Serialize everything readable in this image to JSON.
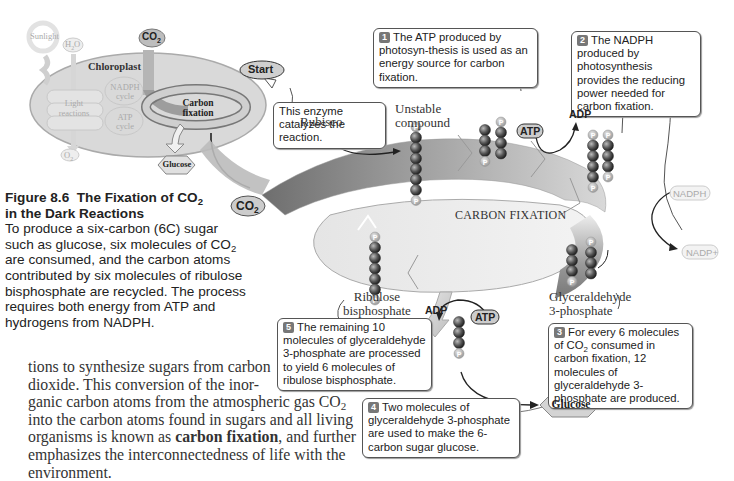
{
  "figure": {
    "number": "Figure 8.6",
    "title_prefix": "The Fixation of CO",
    "title_sub": "2",
    "title_suffix": "in the Dark Reactions",
    "caption_1": "To produce a six-carbon (6C) sugar such as glucose, six molecules of CO",
    "caption_sub": "2",
    "caption_2": " are consumed, and the carbon atoms contributed by six molecules of ribulose bisphosphate are recycled. The process requires both energy from ATP and hydrogens from NADPH."
  },
  "inset": {
    "sunlight": "Sunlight",
    "h2o": "H2O",
    "h2o_main": "H",
    "h2o_sub": "2",
    "h2o_end": "O",
    "co2_main": "CO",
    "co2_sub": "2",
    "chloroplast": "Chloroplast",
    "nadph_cycle_1": "NADPH",
    "nadph_cycle_2": "cycle",
    "atp_cycle_1": "ATP",
    "atp_cycle_2": "cycle",
    "light_1": "Light",
    "light_2": "reactions",
    "carbon_1": "Carbon",
    "carbon_2": "fixation",
    "o2_main": "O",
    "o2_sub": "2",
    "glucose": "Glucose"
  },
  "cycle": {
    "title": "CARBON FIXATION",
    "start": "Start",
    "rubisco": "Rubisco",
    "unstable_1": "Unstable",
    "unstable_2": "compound",
    "g3p_1": "Glyceraldehyde",
    "g3p_2": "3-phosphate",
    "rubp_1": "Ribulose",
    "rubp_2": "bisphosphate",
    "co2_main": "CO",
    "co2_sub": "2",
    "atp_top": "ATP",
    "adp_top": "ADP",
    "nadph": "NADPH",
    "nadp": "NADP+",
    "atp_bottom": "ATP",
    "adp_bottom": "ADP",
    "glucose": "Glucose",
    "phosphate": "P"
  },
  "callouts": {
    "enzyme": "This enzyme catalyzes the reaction.",
    "c1_num": "1",
    "c1": "The ATP produced by photosyn-thesis is used as an energy source for carbon fixation.",
    "c2_num": "2",
    "c2": "The NADPH produced by photosynthesis provides the reducing power needed for carbon fixation.",
    "c3_num": "3",
    "c3_a": "For every 6 molecules of CO",
    "c3_sub": "2",
    "c3_b": " consumed in carbon fixation, 12 molecules of glyceraldehyde 3-phosphate are produced.",
    "c4_num": "4",
    "c4": "Two molecules of glyceraldehyde 3-phosphate are used to make the 6-carbon sugar glucose.",
    "c5_num": "5",
    "c5": "The remaining 10 molecules of glyceraldehyde 3-phosphate are processed to yield 6 molecules of ribulose bisphosphate."
  },
  "body": {
    "line1": "tions to synthesize sugars from carbon",
    "line2": "dioxide. This conversion of the inor-",
    "line3a": "ganic carbon atoms from the atmospheric gas CO",
    "line3sub": "2",
    "line4": "into the carbon atoms found in sugars and all living",
    "line5a": "organisms is known as ",
    "line5b": "carbon fixation",
    "line5c": ", and further",
    "line6": "emphasizes the interconnectedness of life with the",
    "line7": "environment."
  }
}
